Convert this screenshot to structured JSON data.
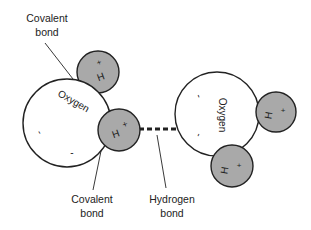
{
  "diagram": {
    "labels": {
      "covalent_top": [
        "Covalent",
        "bond"
      ],
      "covalent_bottom": [
        "Covalent",
        "bond"
      ],
      "hydrogen_bond": [
        "Hydrogen",
        "bond"
      ]
    },
    "molecule_left": {
      "oxygen_label": "Oxygen",
      "oxygen_charge_marks": [
        "-",
        "-"
      ],
      "hydrogens": [
        {
          "label": "H",
          "charge": "+"
        },
        {
          "label": "H",
          "charge": "+"
        }
      ]
    },
    "molecule_right": {
      "oxygen_label": "Oxygen",
      "oxygen_charge_marks": [
        "-",
        "-"
      ],
      "hydrogens": [
        {
          "label": "H",
          "charge": "+"
        },
        {
          "label": "H",
          "charge": "+"
        }
      ]
    },
    "colors": {
      "oxygen_fill": "#ffffff",
      "hydrogen_fill": "#a9a9a9",
      "stroke": "#222222"
    }
  }
}
